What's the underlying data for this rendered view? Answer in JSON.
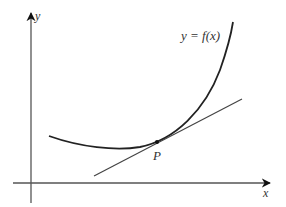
{
  "diagram": {
    "type": "tangent-line-to-curve",
    "axes": {
      "x_label": "x",
      "y_label": "y",
      "color": "#555555"
    },
    "curve": {
      "label": "y = f(x)",
      "color": "#222222",
      "description": "convex increasing curve"
    },
    "tangent": {
      "color": "#444444",
      "description": "tangent line touching curve at P"
    },
    "point": {
      "label": "P",
      "color": "#111111"
    }
  }
}
